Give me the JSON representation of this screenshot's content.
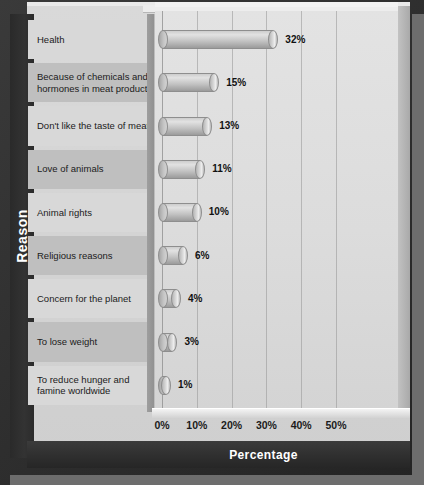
{
  "chart_data": {
    "type": "bar",
    "orientation": "horizontal",
    "title": "",
    "xlabel": "Percentage",
    "ylabel": "Reason",
    "xlim": [
      0,
      57
    ],
    "xtick_labels": [
      "0%",
      "10%",
      "20%",
      "30%",
      "40%",
      "50%"
    ],
    "xtick_values": [
      0,
      10,
      20,
      30,
      40,
      50
    ],
    "grid": "vertical",
    "legend": "none",
    "categories": [
      "Health",
      "Because of chemicals and hormones in meat products",
      "Don't like the taste of meat",
      "Love of animals",
      "Animal rights",
      "Religious reasons",
      "Concern for the planet",
      "To lose weight",
      "To reduce hunger and famine worldwide"
    ],
    "values": [
      32,
      15,
      13,
      11,
      10,
      6,
      4,
      3,
      1
    ],
    "value_labels": [
      "32%",
      "15%",
      "13%",
      "11%",
      "10%",
      "6%",
      "4%",
      "3%",
      "1%"
    ]
  },
  "axes": {
    "y_title": "Reason",
    "x_title": "Percentage"
  },
  "rows": [
    {
      "label": "Health",
      "value": 32,
      "value_label": "32%"
    },
    {
      "label": "Because of chemicals and hormones in meat products",
      "value": 15,
      "value_label": "15%"
    },
    {
      "label": "Don't like the taste of meat",
      "value": 13,
      "value_label": "13%"
    },
    {
      "label": "Love of animals",
      "value": 11,
      "value_label": "11%"
    },
    {
      "label": "Animal rights",
      "value": 10,
      "value_label": "10%"
    },
    {
      "label": "Religious reasons",
      "value": 6,
      "value_label": "6%"
    },
    {
      "label": "Concern for the planet",
      "value": 4,
      "value_label": "4%"
    },
    {
      "label": "To lose weight",
      "value": 3,
      "value_label": "3%"
    },
    {
      "label": "To reduce hunger and famine worldwide",
      "value": 1,
      "value_label": "1%"
    }
  ],
  "colors": {
    "frame": "#2e2e2e",
    "plate": "#d4d4d4",
    "plot_bg": "#dcdcdc",
    "bar": "#c2c2c2",
    "text": "#1b1b1b",
    "axis_text": "#ffffff"
  }
}
